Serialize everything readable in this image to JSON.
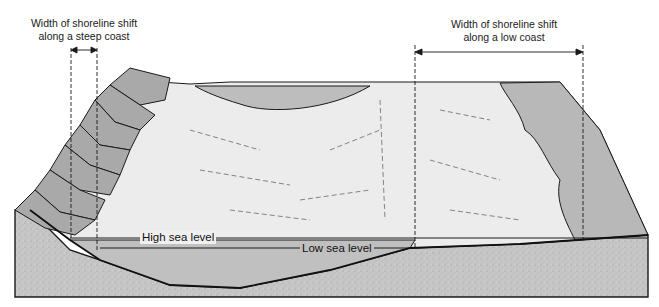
{
  "diagram": {
    "type": "block diagram",
    "labels": {
      "steep_coast_line1": "Width of shoreline shift",
      "steep_coast_line2": "along a steep coast",
      "low_coast_line1": "Width of shoreline shift",
      "low_coast_line2": "along a low coast",
      "high_sea_level": "High sea level",
      "low_sea_level": "Low sea level"
    },
    "colors": {
      "bedrock": "#c4c4c4",
      "cliffs": "#a9a9a9",
      "land_surface": "#ececec",
      "sea_water": "#bdbdbd",
      "low_coast_zone": "#b8b8b8",
      "outline": "#1a1a1a"
    }
  }
}
